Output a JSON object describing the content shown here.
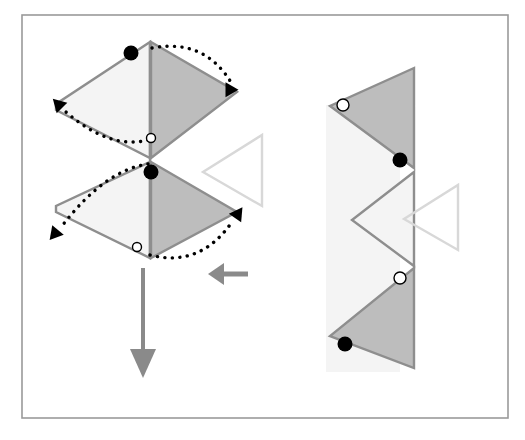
{
  "figure": {
    "canvas": {
      "width": 525,
      "height": 440,
      "background": "#ffffff"
    },
    "frame": {
      "name": "outer-border",
      "x": 22,
      "y": 15,
      "width": 486,
      "height": 403,
      "stroke": "#9a9a9a",
      "stroke_width": 1.6,
      "fill": "none"
    },
    "palette": {
      "shade_dark": "#bdbdbd",
      "shade_light": "#f4f4f4",
      "edge_stroke": "#8e8e8e",
      "ghost_outline": "#d8d8d8",
      "arrow_gray": "#8a8a8a",
      "dot_filled": "#000000",
      "dot_hollow_fill": "#ffffff",
      "dot_hollow_stroke": "#000000",
      "dotted_arrow": "#000000"
    },
    "left_panel": {
      "name": "unfolded-state",
      "shapes": [
        {
          "name": "upper-light-quad",
          "kind": "polygon",
          "fill": "#f4f4f4",
          "stroke": "#8e8e8e",
          "points": "150,42 150,158 56,110 56,104"
        },
        {
          "name": "upper-dark-triangle",
          "kind": "polygon",
          "fill": "#bdbdbd",
          "stroke": "#8e8e8e",
          "points": "151,42 237,92 151,158"
        },
        {
          "name": "lower-light-quad",
          "kind": "polygon",
          "fill": "#f4f4f4",
          "stroke": "#8e8e8e",
          "points": "150,162 150,258 56,212 56,206"
        },
        {
          "name": "lower-dark-triangle",
          "kind": "polygon",
          "fill": "#bdbdbd",
          "stroke": "#8e8e8e",
          "points": "151,162 237,212 151,258"
        },
        {
          "name": "center-fold-line",
          "kind": "line",
          "stroke": "#8e8e8e",
          "x1": 150,
          "y1": 42,
          "x2": 150,
          "y2": 258
        },
        {
          "name": "ghost-outline-triangle-left",
          "kind": "polygon",
          "fill": "none",
          "stroke": "#d8d8d8",
          "points": "262,135 262,206 203,172"
        }
      ],
      "markers": [
        {
          "name": "dot-filled-top",
          "kind": "dot",
          "style": "filled",
          "cx": 131,
          "cy": 53,
          "r": 7.5
        },
        {
          "name": "dot-hollow-mid",
          "kind": "dot",
          "style": "hollow",
          "cx": 151,
          "cy": 138,
          "r": 4.5
        },
        {
          "name": "dot-filled-mid",
          "kind": "dot",
          "style": "filled",
          "cx": 151,
          "cy": 172,
          "r": 7.5
        },
        {
          "name": "dot-hollow-bottom",
          "kind": "dot",
          "style": "hollow",
          "cx": 137,
          "cy": 247,
          "r": 4.5
        }
      ],
      "fold_arrows": [
        {
          "name": "fold-arrow-top-right",
          "direction": "right-over",
          "path": "M 152,48 Q 205,38 232,84",
          "head_at": [
            232,
            86
          ],
          "head_rotation": 120
        },
        {
          "name": "fold-arrow-upper-left",
          "direction": "left-over",
          "path": "M 148,140 Q 110,150 66,112",
          "head_at": [
            62,
            108
          ],
          "head_rotation": 225
        },
        {
          "name": "fold-arrow-lower-left",
          "direction": "left-over",
          "path": "M 148,164 Q 105,170 62,226",
          "head_at": [
            58,
            230
          ],
          "head_rotation": 130
        },
        {
          "name": "fold-arrow-bottom-right",
          "direction": "right-over",
          "path": "M 150,255 Q 200,268 232,222",
          "head_at": [
            235,
            218
          ],
          "head_rotation": 305
        }
      ]
    },
    "transition_arrow": {
      "name": "transition-arrow-left",
      "direction": "left",
      "color": "#8a8a8a",
      "tail_x1": 248,
      "tail_x2": 222,
      "y": 274,
      "head_tip_x": 208,
      "head_half_height": 11
    },
    "down_arrow": {
      "name": "result-down-arrow",
      "direction": "down",
      "color": "#8a8a8a",
      "x": 143,
      "y1": 268,
      "y2": 352,
      "head_tip_y": 378,
      "head_half_width": 13
    },
    "right_panel": {
      "name": "folded-state",
      "shapes": [
        {
          "name": "background-light-strip",
          "kind": "polygon",
          "fill": "#f4f4f4",
          "stroke": "none",
          "points": "326,105 400,105 400,372 326,372"
        },
        {
          "name": "upper-dark-triangle",
          "kind": "polygon",
          "fill": "#bdbdbd",
          "stroke": "#8e8e8e",
          "points": "414,68 414,168 330,106"
        },
        {
          "name": "middle-light-triangle",
          "kind": "polygon",
          "fill": "#f4f4f4",
          "stroke": "#8e8e8e",
          "points": "414,172 414,266 352,220"
        },
        {
          "name": "lower-dark-triangle",
          "kind": "polygon",
          "fill": "#bdbdbd",
          "stroke": "#8e8e8e",
          "points": "414,268 414,368 330,336"
        },
        {
          "name": "ghost-outline-triangle-right",
          "kind": "polygon",
          "fill": "none",
          "stroke": "#d8d8d8",
          "points": "458,185 458,250 404,219"
        }
      ],
      "markers": [
        {
          "name": "dot-hollow-top",
          "cx": 343,
          "cy": 105,
          "r": 6,
          "style": "hollow"
        },
        {
          "name": "dot-filled-upper",
          "cx": 400,
          "cy": 160,
          "r": 7.5,
          "style": "filled"
        },
        {
          "name": "dot-hollow-lower",
          "cx": 400,
          "cy": 278,
          "r": 6,
          "style": "hollow"
        },
        {
          "name": "dot-filled-bottom",
          "cx": 345,
          "cy": 344,
          "r": 7.5,
          "style": "filled"
        }
      ]
    }
  }
}
